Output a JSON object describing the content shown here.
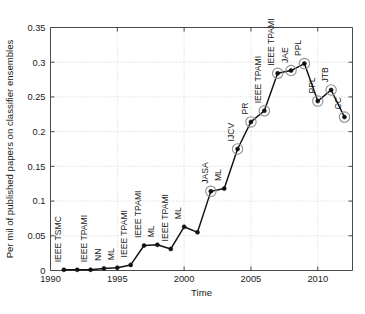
{
  "chart_data": {
    "type": "line",
    "title": "",
    "xlabel": "Time",
    "ylabel": "Per mil of published papers on classifier ensembles",
    "xlim": [
      1990,
      2012.6
    ],
    "ylim": [
      0,
      0.35
    ],
    "xticks": [
      1990,
      1995,
      2000,
      2005,
      2010
    ],
    "xticklabels": [
      "1990",
      "1995",
      "2000",
      "2005",
      "2010"
    ],
    "yticks": [
      0,
      0.05,
      0.1,
      0.15,
      0.2,
      0.25,
      0.3,
      0.35
    ],
    "yticklabels": [
      "0",
      "0.05",
      "0.1",
      "0.15",
      "0.2",
      "0.25",
      "0.3",
      "0.35"
    ],
    "grid": true,
    "legend": "none",
    "series": [
      {
        "name": "Per mil of published papers on classifier ensembles",
        "x": [
          1991,
          1992,
          1993,
          1994,
          1995,
          1996,
          1997,
          1998,
          1999,
          2000,
          2001,
          2002,
          2003,
          2004,
          2005,
          2006,
          2007,
          2008,
          2009,
          2010,
          2011,
          2012
        ],
        "values": [
          0.001,
          0.001,
          0.001,
          0.003,
          0.004,
          0.008,
          0.036,
          0.037,
          0.031,
          0.063,
          0.055,
          0.114,
          0.118,
          0.175,
          0.214,
          0.23,
          0.284,
          0.288,
          0.298,
          0.244,
          0.26,
          0.221
        ]
      }
    ],
    "annotations": [
      {
        "x": 1991,
        "y": 0.001,
        "text": "IEEE TSMC",
        "highlighted": false
      },
      {
        "x": 1993,
        "y": 0.001,
        "text": "IEEE TPAMI",
        "highlighted": false
      },
      {
        "x": 1994,
        "y": 0.003,
        "text": "NN",
        "highlighted": false
      },
      {
        "x": 1995,
        "y": 0.004,
        "text": "ML",
        "highlighted": false
      },
      {
        "x": 1996,
        "y": 0.008,
        "text": "IEEE TPAMI",
        "highlighted": false
      },
      {
        "x": 1997,
        "y": 0.036,
        "text": "IEEE TPAMI",
        "highlighted": false
      },
      {
        "x": 1998,
        "y": 0.037,
        "text": "ML",
        "highlighted": false
      },
      {
        "x": 1999,
        "y": 0.031,
        "text": "IEEE TPAMI",
        "highlighted": false
      },
      {
        "x": 2000,
        "y": 0.063,
        "text": "ML",
        "highlighted": false
      },
      {
        "x": 2002,
        "y": 0.114,
        "text": "JASA",
        "highlighted": true
      },
      {
        "x": 2003,
        "y": 0.118,
        "text": "ML",
        "highlighted": false
      },
      {
        "x": 2004,
        "y": 0.175,
        "text": "IJCV",
        "highlighted": true
      },
      {
        "x": 2005,
        "y": 0.214,
        "text": "PR",
        "highlighted": true
      },
      {
        "x": 2006,
        "y": 0.23,
        "text": "IEEE TPAMI",
        "highlighted": true
      },
      {
        "x": 2007,
        "y": 0.284,
        "text": "IEEE TPAMI",
        "highlighted": true
      },
      {
        "x": 2008,
        "y": 0.288,
        "text": "JAE",
        "highlighted": true
      },
      {
        "x": 2009,
        "y": 0.298,
        "text": "PPL",
        "highlighted": true
      },
      {
        "x": 2010,
        "y": 0.244,
        "text": "PPL",
        "highlighted": true
      },
      {
        "x": 2011,
        "y": 0.26,
        "text": "JTB",
        "highlighted": true
      },
      {
        "x": 2012,
        "y": 0.221,
        "text": "CC",
        "highlighted": true
      }
    ]
  },
  "colors": {
    "line": "#111111",
    "grid": "#bdbdbd",
    "axis": "#4a4a4a",
    "ring": "#8f8f8f",
    "background": "#ffffff"
  },
  "caption": {
    "partial_mark": ""
  }
}
